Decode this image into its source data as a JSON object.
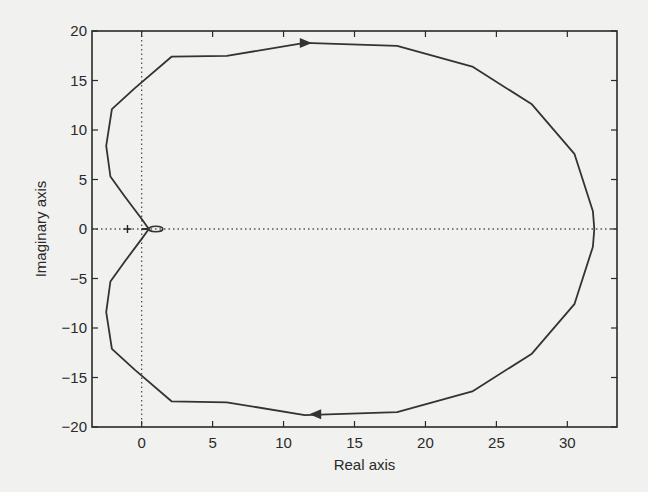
{
  "chart_data": {
    "type": "line",
    "title": "",
    "xlabel": "Real axis",
    "ylabel": "Imaginary axis",
    "xlim": [
      -3.5,
      33.5
    ],
    "ylim": [
      -20,
      20
    ],
    "xticks": [
      0,
      5,
      10,
      15,
      20,
      25,
      30
    ],
    "yticks": [
      -20,
      -15,
      -10,
      -5,
      0,
      5,
      10,
      15,
      20
    ],
    "grid": false,
    "legend": null,
    "reference_lines": [
      {
        "orientation": "horizontal",
        "value": 0,
        "style": "dotted"
      },
      {
        "orientation": "vertical",
        "value": 0,
        "style": "dotted"
      }
    ],
    "marker": {
      "label": "critical-point",
      "x": -1,
      "y": 0,
      "symbol": "+"
    },
    "series": [
      {
        "name": "Nyquist curve (positive frequencies)",
        "x": [
          0.5,
          0.0,
          -1.2,
          -2.2,
          -2.5,
          -2.1,
          -0.5,
          2.1,
          6.0,
          11.5,
          18.0,
          23.3,
          27.5,
          30.5,
          31.8,
          31.9
        ],
        "y": [
          0.0,
          1.0,
          3.3,
          5.3,
          8.4,
          12.1,
          14.2,
          17.4,
          17.5,
          18.8,
          18.5,
          16.4,
          12.6,
          7.6,
          1.8,
          0.0
        ]
      },
      {
        "name": "Nyquist curve (negative frequencies, mirror)",
        "x": [
          31.9,
          31.8,
          30.5,
          27.5,
          23.3,
          18.0,
          11.5,
          6.0,
          2.1,
          -0.5,
          -2.1,
          -2.5,
          -2.2,
          -1.2,
          0.0,
          0.5
        ],
        "y": [
          0.0,
          -1.8,
          -7.6,
          -12.6,
          -16.4,
          -18.5,
          -18.8,
          -17.5,
          -17.4,
          -14.2,
          -12.1,
          -8.4,
          -5.3,
          -3.3,
          -1.0,
          0.0
        ]
      }
    ],
    "arrows": [
      {
        "x": 11.5,
        "y": 18.8,
        "direction": "right"
      },
      {
        "x": 12.3,
        "y": -18.7,
        "direction": "left"
      }
    ]
  },
  "axes": {
    "xlabel": "Real axis",
    "ylabel": "Imaginary axis",
    "xtick_labels": [
      "0",
      "5",
      "10",
      "15",
      "20",
      "25",
      "30"
    ],
    "ytick_labels": [
      "20",
      "15",
      "10",
      "5",
      "0",
      "-5",
      "-10",
      "-15",
      "-20"
    ]
  },
  "colors": {
    "background": "#f1f1ef",
    "curve": "#333333",
    "axes": "#2a2a2a"
  }
}
